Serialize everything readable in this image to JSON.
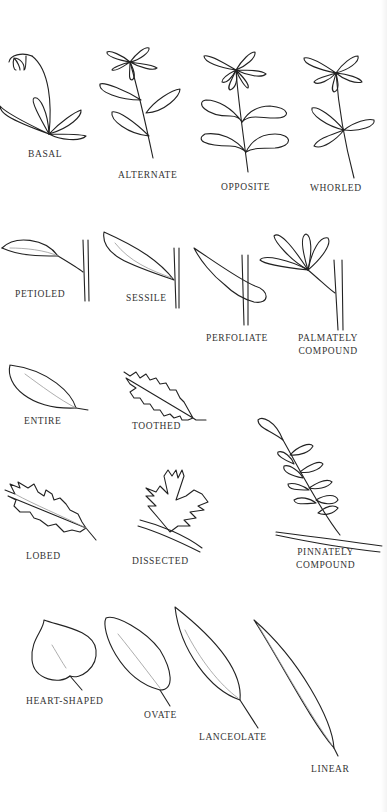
{
  "sections": [
    {
      "name": "leaf-arrangement",
      "items": [
        {
          "key": "basal",
          "label": "BASAL"
        },
        {
          "key": "alternate",
          "label": "ALTERNATE"
        },
        {
          "key": "opposite",
          "label": "OPPOSITE"
        },
        {
          "key": "whorled",
          "label": "WHORLED"
        }
      ]
    },
    {
      "name": "leaf-attachment",
      "items": [
        {
          "key": "petioled",
          "label": "PETIOLED"
        },
        {
          "key": "sessile",
          "label": "SESSILE"
        },
        {
          "key": "perfoliate",
          "label": "PERFOLIATE"
        },
        {
          "key": "palmately-compound",
          "label_line1": "PALMATELY",
          "label_line2": "COMPOUND"
        }
      ]
    },
    {
      "name": "leaf-margin",
      "items": [
        {
          "key": "entire",
          "label": "ENTIRE"
        },
        {
          "key": "toothed",
          "label": "TOOTHED"
        },
        {
          "key": "lobed",
          "label": "LOBED"
        },
        {
          "key": "dissected",
          "label": "DISSECTED"
        },
        {
          "key": "pinnately-compound",
          "label_line1": "PINNATELY",
          "label_line2": "COMPOUND"
        }
      ]
    },
    {
      "name": "leaf-shape",
      "items": [
        {
          "key": "heart-shaped",
          "label": "HEART-SHAPED"
        },
        {
          "key": "ovate",
          "label": "OVATE"
        },
        {
          "key": "lanceolate",
          "label": "LANCEOLATE"
        },
        {
          "key": "linear",
          "label": "LINEAR"
        }
      ]
    }
  ]
}
